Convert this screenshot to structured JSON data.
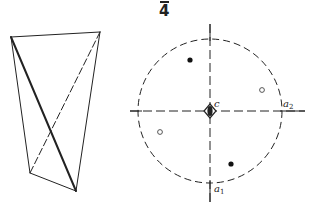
{
  "figure": {
    "title_label": "4",
    "title_overline": true,
    "labels": {
      "center": "c",
      "axis1_main": "a",
      "axis1_sub": "1",
      "axis2_main": "a",
      "axis2_sub": "2"
    },
    "colors": {
      "stroke": "#222222",
      "background": "#ffffff"
    }
  },
  "tetrahedron": {
    "vertices": [
      [
        11,
        37
      ],
      [
        100,
        32
      ],
      [
        30,
        173
      ],
      [
        76,
        191
      ]
    ],
    "solid_edges": [
      [
        0,
        1
      ],
      [
        0,
        2
      ],
      [
        1,
        3
      ],
      [
        2,
        3
      ]
    ],
    "bold_edges": [
      [
        0,
        3
      ]
    ],
    "dashed_edges": [
      [
        1,
        2
      ]
    ]
  },
  "stereogram": {
    "center": [
      210,
      111
    ],
    "radius": 72,
    "filled_points": [
      [
        190,
        60
      ],
      [
        231,
        164
      ]
    ],
    "open_points": [
      [
        262,
        90
      ],
      [
        160,
        132
      ]
    ]
  }
}
